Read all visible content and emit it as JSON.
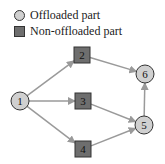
{
  "legend": [
    {
      "label": "Offloaded part",
      "shape": "circle",
      "color": "#d0d0d0"
    },
    {
      "label": "Non-offloaded part",
      "shape": "square",
      "color": "#6e6e6e"
    }
  ],
  "nodes": [
    {
      "id": "1",
      "type": "offloaded",
      "x": 20,
      "y": 101
    },
    {
      "id": "2",
      "type": "non-offloaded",
      "x": 82,
      "y": 55
    },
    {
      "id": "3",
      "type": "non-offloaded",
      "x": 83,
      "y": 101
    },
    {
      "id": "4",
      "type": "non-offloaded",
      "x": 83,
      "y": 149
    },
    {
      "id": "5",
      "type": "offloaded",
      "x": 144,
      "y": 125
    },
    {
      "id": "6",
      "type": "offloaded",
      "x": 145,
      "y": 74
    }
  ],
  "edges": [
    [
      "1",
      "2"
    ],
    [
      "1",
      "3"
    ],
    [
      "1",
      "4"
    ],
    [
      "2",
      "6"
    ],
    [
      "3",
      "5"
    ],
    [
      "4",
      "5"
    ],
    [
      "5",
      "6"
    ]
  ],
  "colors": {
    "edge": "#9a9a9a",
    "circle_fill": "#d0d0d0",
    "square_fill": "#6e6e6e",
    "stroke": "#333333"
  }
}
